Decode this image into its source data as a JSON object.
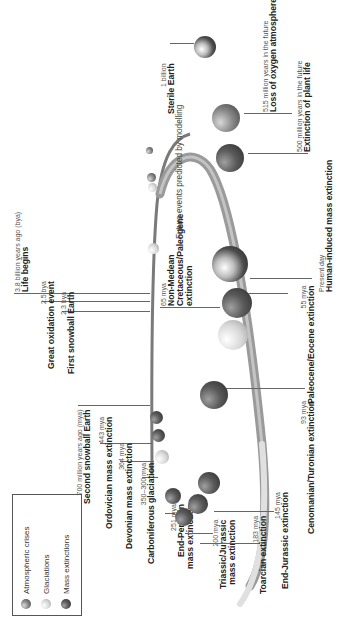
{
  "legend": {
    "items": [
      {
        "label": "Atmospheric crises",
        "type": "atmospheric"
      },
      {
        "label": "Glaciations",
        "type": "glaciation"
      },
      {
        "label": "Mass extinctions",
        "type": "extinction"
      }
    ]
  },
  "future_note": "Future events predicted by modelling",
  "events": [
    {
      "id": "life",
      "sub": "3.8 billion years ago (bya)",
      "title": "Life begins",
      "marker": "atmospheric"
    },
    {
      "id": "goe",
      "sub": "2.5 bya",
      "title": "Great oxidation event",
      "marker": "atmospheric"
    },
    {
      "id": "snow1",
      "sub": "2.3 bya",
      "title": "First snowball Earth",
      "marker": "glaciation"
    },
    {
      "id": "snow2",
      "sub": "700 million years ago (mya)",
      "title": "Second snowball Earth",
      "marker": "glaciation"
    },
    {
      "id": "ordovician",
      "sub": "443 mya",
      "title": "Ordovician mass extinction",
      "marker": "extinction"
    },
    {
      "id": "devonian",
      "sub": "364 mya",
      "title": "Devonian mass extinction",
      "marker": "extinction"
    },
    {
      "id": "carboniferous",
      "sub": "350–300 mya",
      "title": "Carboniferous glaciation",
      "marker": "glaciation"
    },
    {
      "id": "permian",
      "sub": "251 mya",
      "title": "End-Permian mass extinction",
      "title_l1": "End-Permian",
      "title_l2": "mass extinction",
      "marker": "extinction"
    },
    {
      "id": "triassic",
      "sub": "200 mya",
      "title": "Triassic/Jurassic mass extinction",
      "title_l1": "Triassic/Jurassic",
      "title_l2": "mass extinction",
      "marker": "extinction"
    },
    {
      "id": "toarcian",
      "sub": "183 mya",
      "title": "Toarcian extinction",
      "marker": "extinction"
    },
    {
      "id": "endjurassic",
      "sub": "145 mya",
      "title": "End-Jurassic extinction",
      "marker": "extinction"
    },
    {
      "id": "cenomanian",
      "sub": "93 mya",
      "title": "Cenomanian/Turonian extinction",
      "marker": "extinction"
    },
    {
      "id": "kpg",
      "sub": "65 mya",
      "title": "Non-Medean Cretaceous/Paleogene extinction",
      "title_l1": "Non-Medean",
      "title_l2": "Cretaceous/Paleogene",
      "title_l3": "extinction",
      "marker": "extinction"
    },
    {
      "id": "petm",
      "sub": "55 mya",
      "title": "Paleocene/Eocene extinction",
      "marker": "extinction"
    },
    {
      "id": "present",
      "sub": "Present day",
      "title": "Human-induced mass extinction",
      "marker": "earth"
    },
    {
      "id": "plant",
      "sub": "500 million years in the future",
      "title": "Extinction of plant life",
      "marker": "extinction"
    },
    {
      "id": "oxygen",
      "sub": "515 million years in the future",
      "title": "Loss of oxygen atmosphere",
      "marker": "atmospheric"
    },
    {
      "id": "sterile",
      "sub": "1 billion",
      "title": "Sterile Earth",
      "marker": "earth"
    }
  ],
  "colors": {
    "arc": "#8a8a8a",
    "line": "#666666",
    "text": "#222222"
  }
}
